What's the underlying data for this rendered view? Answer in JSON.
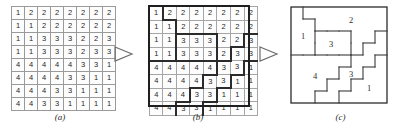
{
  "figure": {
    "panels": [
      {
        "id": "a",
        "caption": "(a)"
      },
      {
        "id": "b",
        "caption": "(b)"
      },
      {
        "id": "c",
        "caption": "(c)"
      }
    ],
    "arrows": [
      {
        "name": "arrow-a-to-b",
        "glyph": "triangle-right"
      },
      {
        "name": "arrow-b-to-c",
        "glyph": "triangle-right"
      }
    ]
  },
  "chart_data": {
    "type": "heatmap",
    "title": "",
    "subtitle": "",
    "xlabel": "",
    "ylabel": "",
    "rows": 8,
    "cols": 8,
    "grid_values": [
      [
        1,
        2,
        2,
        2,
        2,
        2,
        2,
        2
      ],
      [
        1,
        1,
        2,
        2,
        2,
        2,
        2,
        2
      ],
      [
        1,
        1,
        3,
        3,
        3,
        2,
        2,
        3
      ],
      [
        1,
        1,
        3,
        3,
        3,
        2,
        3,
        3
      ],
      [
        4,
        4,
        4,
        4,
        4,
        3,
        3,
        1
      ],
      [
        4,
        4,
        4,
        4,
        3,
        3,
        1,
        1
      ],
      [
        4,
        4,
        4,
        3,
        3,
        1,
        1,
        1
      ],
      [
        4,
        4,
        3,
        3,
        1,
        1,
        1,
        1
      ]
    ],
    "panel_a": {
      "caption": "(a)",
      "description": "raw label grid, thin cell borders only",
      "values": [
        [
          1,
          2,
          2,
          2,
          2,
          2,
          2,
          2
        ],
        [
          1,
          1,
          2,
          2,
          2,
          2,
          2,
          2
        ],
        [
          1,
          1,
          3,
          3,
          3,
          2,
          2,
          3
        ],
        [
          1,
          1,
          3,
          3,
          3,
          2,
          3,
          3
        ],
        [
          4,
          4,
          4,
          4,
          4,
          3,
          3,
          1
        ],
        [
          4,
          4,
          4,
          4,
          3,
          3,
          1,
          1
        ],
        [
          4,
          4,
          4,
          3,
          3,
          1,
          1,
          1
        ],
        [
          4,
          4,
          3,
          3,
          1,
          1,
          1,
          1
        ]
      ]
    },
    "panel_b": {
      "caption": "(b)",
      "description": "same label grid with thick region boundaries drawn between differing labels",
      "values": [
        [
          1,
          2,
          2,
          2,
          2,
          2,
          2,
          2
        ],
        [
          1,
          1,
          2,
          2,
          2,
          2,
          2,
          2
        ],
        [
          1,
          1,
          3,
          3,
          3,
          2,
          2,
          3
        ],
        [
          1,
          1,
          3,
          3,
          3,
          2,
          3,
          3
        ],
        [
          4,
          4,
          4,
          4,
          4,
          3,
          3,
          1
        ],
        [
          4,
          4,
          4,
          4,
          3,
          3,
          1,
          1
        ],
        [
          4,
          4,
          4,
          3,
          3,
          1,
          1,
          1
        ],
        [
          4,
          4,
          3,
          3,
          1,
          1,
          1,
          1
        ]
      ]
    },
    "panel_c": {
      "caption": "(c)",
      "description": "region outlines only, each connected region annotated with its label",
      "region_labels": [
        {
          "label": "1",
          "x": 14,
          "y": 34
        },
        {
          "label": "2",
          "x": 62,
          "y": 18
        },
        {
          "label": "3",
          "x": 42,
          "y": 42
        },
        {
          "label": "4",
          "x": 26,
          "y": 74
        },
        {
          "label": "3",
          "x": 62,
          "y": 72
        },
        {
          "label": "1",
          "x": 80,
          "y": 86
        }
      ]
    },
    "legend": [],
    "grid": true
  },
  "colors": {
    "cell_border": "#9a9a9a",
    "region_border": "#2b2b2b",
    "text": "#262626",
    "arrow": "#6d6d6d",
    "background": "#ffffff"
  }
}
